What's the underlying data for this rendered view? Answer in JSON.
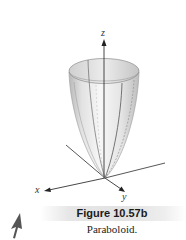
{
  "figure": {
    "title": "Figure 10.57b",
    "caption": "Paraboloid.",
    "surface": "paraboloid",
    "axes": {
      "x_label": "x",
      "y_label": "y",
      "z_label": "z"
    }
  },
  "colors": {
    "axis": "#333333",
    "surface_light": "#f2f2f2",
    "surface_mid": "#d4d4d4",
    "surface_dark": "#a8a8a8",
    "caption_bar": "#e2e2e2",
    "cursor": "#555555"
  },
  "icons": {
    "cursor": "arrow-cursor-icon"
  }
}
